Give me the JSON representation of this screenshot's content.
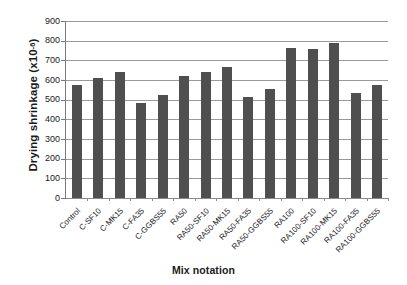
{
  "chart_data": {
    "type": "bar",
    "title": "",
    "xlabel": "Mix notation",
    "ylabel": "Drying shrinkage (x10-6)",
    "ylabel_base": "Drying shrinkage (x10",
    "ylabel_sup": "-6",
    "ylabel_close": ")",
    "ylim": [
      0,
      900
    ],
    "ytick_step": 100,
    "grid": true,
    "legend": false,
    "bar_color": "#4f4f4f",
    "gridline_color": "#9a9a9a",
    "axis_color": "#7a7a7a",
    "yticks": [
      900,
      800,
      700,
      600,
      500,
      400,
      300,
      200,
      100,
      0
    ],
    "categories": [
      "Control",
      "C-SF10",
      "C-MK15",
      "C-FA35",
      "C-GGBS55",
      "RA50",
      "RA50-SF10",
      "RA50-MK15",
      "RA50-FA35",
      "RA50-GGBS55",
      "RA100",
      "RA100-SF10",
      "RA100-MK15",
      "RA100-FA35",
      "RA100-GGBS55"
    ],
    "values": [
      575,
      612,
      640,
      483,
      523,
      618,
      640,
      668,
      512,
      555,
      765,
      758,
      788,
      532,
      575
    ]
  }
}
